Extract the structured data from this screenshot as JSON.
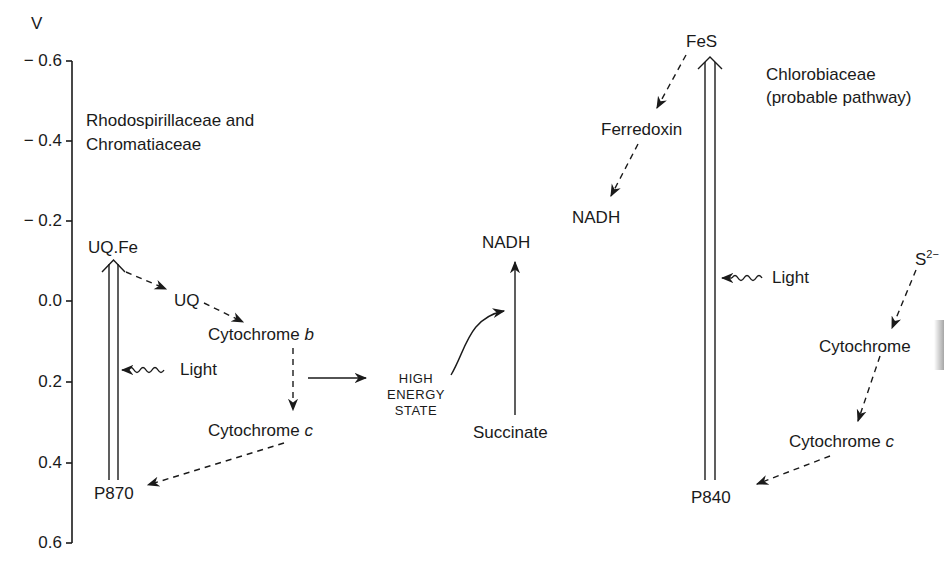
{
  "axis": {
    "unit": "V",
    "ticks": [
      "− 0.6",
      "− 0.4",
      "− 0.2",
      "0.0",
      "0.2",
      "0.4",
      "0.6"
    ]
  },
  "left_panel": {
    "title_line1": "Rhodospirillaceae and",
    "title_line2": "Chromatiaceae",
    "nodes": {
      "uq_fe": "UQ.Fe",
      "uq": "UQ",
      "cyt_b_prefix": "Cytochrome ",
      "cyt_b_suffix": "b",
      "cyt_c_prefix": "Cytochrome ",
      "cyt_c_suffix": "c",
      "p870": "P870",
      "light": "Light"
    }
  },
  "middle": {
    "high_energy_line1": "HIGH",
    "high_energy_line2": "ENERGY",
    "high_energy_line3": "STATE",
    "nadh": "NADH",
    "succinate": "Succinate"
  },
  "right_panel": {
    "title_line1": "Chlorobiaceae",
    "title_line2": "(probable pathway)",
    "nodes": {
      "fes": "FeS",
      "ferredoxin": "Ferredoxin",
      "nadh": "NADH",
      "light": "Light",
      "sulfide_base": "S",
      "sulfide_sup": "2−",
      "cyt_prefix_top": "Cytochrome ",
      "cyt_c_prefix": "Cytochrome ",
      "cyt_c_suffix": "c",
      "p840": "P840"
    }
  }
}
